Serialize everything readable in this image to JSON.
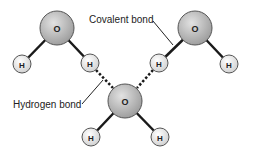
{
  "diagram": {
    "labels": {
      "covalent": "Covalent bond",
      "hydrogen": "Hydrogen bond"
    },
    "atoms": {
      "oxygen_symbol": "O",
      "hydrogen_symbol": "H"
    },
    "molecules": [
      {
        "name": "water-molecule-top-left",
        "O": [
          57,
          28
        ],
        "H": [
          [
            22,
            64
          ],
          [
            90,
            63
          ]
        ]
      },
      {
        "name": "water-molecule-top-right",
        "O": [
          195,
          28
        ],
        "H": [
          [
            159,
            63
          ],
          [
            229,
            64
          ]
        ]
      },
      {
        "name": "water-molecule-bottom",
        "O": [
          125,
          101
        ],
        "H": [
          [
            91,
            137
          ],
          [
            160,
            137
          ]
        ]
      }
    ],
    "colors": {
      "oxygen_fill": "#b8b8b8",
      "hydrogen_fill": "#e6e6e6",
      "bond": "#1a1a1a",
      "outline": "#555555"
    }
  }
}
